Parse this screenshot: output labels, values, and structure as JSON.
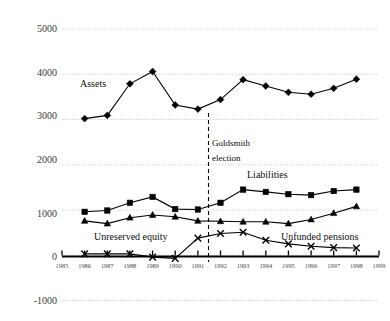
{
  "chart_data": {
    "type": "line",
    "title": "",
    "subtitle": "",
    "xlabel": "",
    "ylabel": "",
    "xlim": [
      1985,
      1999
    ],
    "ylim": [
      -1000,
      5000
    ],
    "grid": true,
    "legend": "inline-annotations",
    "x": [
      1986,
      1987,
      1988,
      1989,
      1990,
      1991,
      1992,
      1993,
      1994,
      1995,
      1996,
      1997,
      1998
    ],
    "x_tick_labels": [
      "1985",
      "1986",
      "1987",
      "1988",
      "1989",
      "1990",
      "1991",
      "1992",
      "1993",
      "1994",
      "1995",
      "1996",
      "1997",
      "1998",
      "1999"
    ],
    "y_tick_labels": [
      "5000",
      "4000",
      "3000",
      "2000",
      "1000",
      "0",
      "-1000"
    ],
    "y_ticks": [
      5000,
      4000,
      3000,
      2000,
      1000,
      0,
      -1000
    ],
    "series": [
      {
        "name": "Assets",
        "marker": "diamond",
        "label": "Assets",
        "values": [
          3020,
          3090,
          3790,
          4060,
          3320,
          3230,
          3440,
          3880,
          3740,
          3600,
          3560,
          3690,
          3890
        ]
      },
      {
        "name": "Liabilities",
        "marker": "square",
        "label": "Liabilities",
        "values": [
          960,
          990,
          1160,
          1290,
          1020,
          1010,
          1160,
          1450,
          1400,
          1350,
          1330,
          1420,
          1450
        ]
      },
      {
        "name": "Unfunded pensions",
        "marker": "triangle",
        "label": "Unfunded pensions",
        "values": [
          760,
          700,
          830,
          890,
          850,
          760,
          750,
          740,
          740,
          700,
          790,
          930,
          1080
        ]
      },
      {
        "name": "Unreserved equity",
        "marker": "cross",
        "label": "Unreserved equity",
        "values": [
          30,
          30,
          30,
          -40,
          -70,
          380,
          480,
          510,
          330,
          250,
          200,
          170,
          160
        ]
      }
    ],
    "annotations": [
      {
        "name": "goldsmith-election",
        "lines": [
          "Goldsmith",
          "election"
        ],
        "x": 1992,
        "type": "vertical-dashed-line"
      }
    ]
  },
  "labels": {
    "assets": "Assets",
    "liabilities": "Liabilities",
    "unreserved_equity": "Unreserved equity",
    "unfunded_pensions": "Unfunded pensions",
    "goldsmith_line1": "Goldsmith",
    "goldsmith_line2": "election"
  },
  "y_axis": {
    "t5000": "5000",
    "t4000": "4000",
    "t3000": "3000",
    "t2000": "2000",
    "t1000": "1000",
    "t0": "0",
    "tm1000": "-1000"
  },
  "x_axis": {
    "t1985": "1985",
    "t1986": "1986",
    "t1987": "1987",
    "t1988": "1988",
    "t1989": "1989",
    "t1990": "1990",
    "t1991": "1991",
    "t1992": "1992",
    "t1993": "1993",
    "t1994": "1994",
    "t1995": "1995",
    "t1996": "1996",
    "t1997": "1997",
    "t1998": "1998",
    "t1999": "1999"
  },
  "colors": {
    "ink": "#000000",
    "grid": "#c9c9c9",
    "background": "#ffffff"
  }
}
